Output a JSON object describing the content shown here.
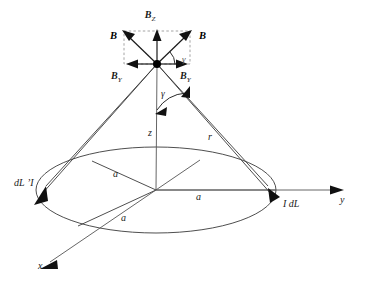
{
  "figure": {
    "background_color": "#ffffff",
    "line_color": "#3a3a3a",
    "vector_color": "#1a1a1a",
    "dashed_color": "#9a9a9a",
    "width": 366,
    "height": 294
  },
  "labels": {
    "b_z": "B",
    "b_z_sub": "Z",
    "b_left": "B",
    "b_right": "B",
    "b_y_left": "B",
    "b_y_left_sub": "Y",
    "b_y_right": "B",
    "b_y_right_sub": "Y",
    "gamma_upper": "γ",
    "gamma_lower": "γ",
    "z_axis": "z",
    "r_line": "r",
    "radius_upper_left": "a",
    "radius_right": "a",
    "radius_lower_left": "a",
    "x_axis": "x",
    "y_axis": "y",
    "dl_prime": "dL ’I",
    "i_dl": "I dL"
  },
  "geometry": {
    "apex_x": 157,
    "apex_y": 64,
    "center_x": 156,
    "center_y": 190,
    "ellipse_rx": 120,
    "ellipse_ry": 43,
    "z_height": 126
  }
}
